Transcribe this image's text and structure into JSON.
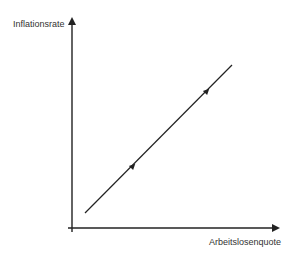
{
  "diagram": {
    "y_axis_label": "Inflationsrate",
    "x_axis_label": "Arbeitslosenquote",
    "line_color": "#222222",
    "axis_color": "#222222",
    "curve": {
      "start": [
        85,
        213
      ],
      "end": [
        232,
        65
      ],
      "direction_arrows": [
        [
          133,
          166
        ],
        [
          207,
          91
        ]
      ]
    }
  }
}
